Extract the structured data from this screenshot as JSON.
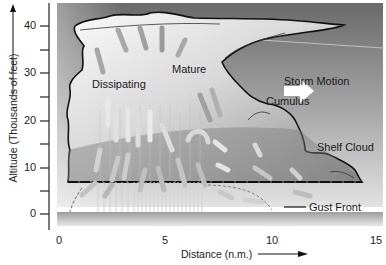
{
  "diagram": {
    "type": "thunderstorm cross-section",
    "y_axis": {
      "label": "Altitude (Thousands of feet)",
      "ticks": [
        "0",
        "10",
        "20",
        "30",
        "40"
      ],
      "range": [
        0,
        45
      ]
    },
    "x_axis": {
      "label": "Distance (n.m.)",
      "ticks": [
        "0",
        "5",
        "10",
        "15"
      ],
      "range": [
        0,
        15
      ]
    },
    "labels": {
      "dissipating": "Dissipating",
      "mature": "Mature",
      "cumulus": "Cumulus",
      "storm_motion": "Storm Motion",
      "shelf_cloud": "Shelf Cloud",
      "gust_front": "Gust Front"
    },
    "colors": {
      "sky_top": "#6e6e6e",
      "sky_bottom": "#d8d8d8",
      "cloud_light": "#f4f4f4",
      "cloud_dark": "#8a8a8a",
      "outline": "#111111",
      "ground": "#b5b5b5"
    }
  }
}
